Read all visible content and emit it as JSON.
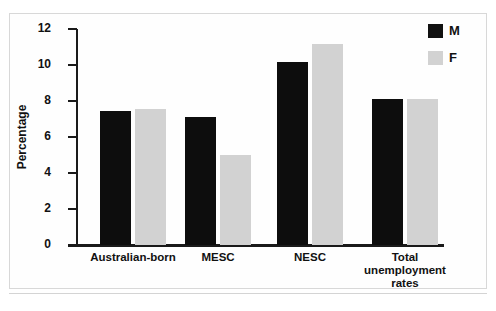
{
  "chart_data": {
    "type": "bar",
    "title": "",
    "subtitle": "",
    "xlabel": "",
    "ylabel": "Percentage",
    "categories": [
      "Australian-born",
      "MESC",
      "NESC",
      "Total unemployment rates"
    ],
    "series": [
      {
        "name": "M",
        "color": "#0d0d0d",
        "values": [
          7.4,
          7.1,
          10.1,
          8.1
        ]
      },
      {
        "name": "F",
        "color": "#d2d2d2",
        "values": [
          7.5,
          5.0,
          11.1,
          8.1
        ]
      }
    ],
    "ylim": [
      0,
      12
    ],
    "yticks": [
      0,
      2,
      4,
      6,
      8,
      10,
      12
    ],
    "ytick_labels": [
      "0",
      "2",
      "4",
      "6",
      "8",
      "10",
      "12"
    ],
    "grid": false,
    "legend_position": "top-right",
    "legend": [
      {
        "label": "M",
        "color": "#0d0d0d"
      },
      {
        "label": "F",
        "color": "#d2d2d2"
      }
    ]
  },
  "axis": {
    "y_title": "Percentage",
    "ticks": [
      "12",
      "10",
      "8",
      "6",
      "4",
      "2",
      "0"
    ]
  },
  "groups": [
    {
      "label": "Australian-born",
      "lines": [
        "Australian-born"
      ]
    },
    {
      "label": "MESC",
      "lines": [
        "MESC"
      ]
    },
    {
      "label": "NESC",
      "lines": [
        "NESC"
      ]
    },
    {
      "label": "Total unemployment rates",
      "lines": [
        "Total",
        "unemployment",
        "rates"
      ]
    }
  ],
  "legend": {
    "m_label": "M",
    "f_label": "F"
  },
  "caption": {
    "text": ""
  },
  "colors": {
    "male": "#0d0d0d",
    "female": "#d2d2d2",
    "axis": "#1a1a1a",
    "frame": "#d8d8d8"
  }
}
